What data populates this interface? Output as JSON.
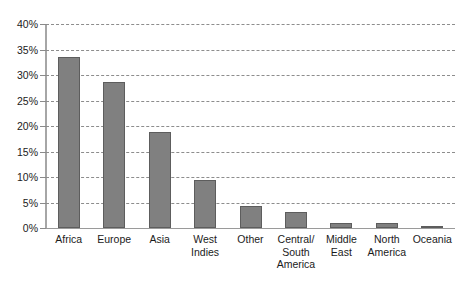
{
  "chart_data": {
    "type": "bar",
    "title": "",
    "subtitle": "",
    "xlabel": "",
    "ylabel": "",
    "categories": [
      "Africa",
      "Europe",
      "Asia",
      "West\nIndies",
      "Other",
      "Central/\nSouth\nAmerica",
      "Middle\nEast",
      "North\nAmerica",
      "Oceania"
    ],
    "values": [
      33.6,
      28.6,
      18.8,
      9.5,
      4.4,
      3.1,
      0.9,
      0.9,
      0.3
    ],
    "value_unit": "%",
    "ylim": [
      0,
      40
    ],
    "ytick_values": [
      0,
      5,
      10,
      15,
      20,
      25,
      30,
      35,
      40
    ],
    "ytick_labels": [
      "0%",
      "5%",
      "10%",
      "15%",
      "20%",
      "25%",
      "30%",
      "35%",
      "40%"
    ],
    "grid": true,
    "grid_style": "dashed-horizontal",
    "legend": false,
    "legend_position": "none",
    "series": [
      {
        "name": "",
        "values": [
          33.6,
          28.6,
          18.8,
          9.5,
          4.4,
          3.1,
          0.9,
          0.9,
          0.3
        ]
      }
    ]
  },
  "colors": {
    "bar_fill": "#808080",
    "bar_stroke": "#5d5d5d",
    "gridline": "#8d8d8d",
    "axis": "#a6a6a6",
    "text": "#1b1b1b",
    "background": "#ffffff"
  }
}
